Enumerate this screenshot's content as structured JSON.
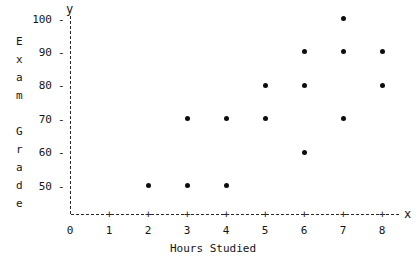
{
  "chart_data": {
    "type": "scatter",
    "title": "",
    "xlabel": "Hours Studied",
    "ylabel": "Exam Grade",
    "x_axis_name": "x",
    "y_axis_name": "y",
    "xticks": [
      0,
      1,
      2,
      3,
      4,
      5,
      6,
      7,
      8
    ],
    "yticks": [
      50,
      60,
      70,
      80,
      90,
      100
    ],
    "xlim": [
      0,
      8.6
    ],
    "ylim": [
      45,
      103
    ],
    "grid": false,
    "legend": null,
    "points": [
      {
        "x": 2,
        "y": 50
      },
      {
        "x": 3,
        "y": 50
      },
      {
        "x": 4,
        "y": 50
      },
      {
        "x": 3,
        "y": 70
      },
      {
        "x": 4,
        "y": 70
      },
      {
        "x": 5,
        "y": 70
      },
      {
        "x": 7,
        "y": 70
      },
      {
        "x": 6,
        "y": 60
      },
      {
        "x": 5,
        "y": 80
      },
      {
        "x": 6,
        "y": 80
      },
      {
        "x": 8,
        "y": 80
      },
      {
        "x": 6,
        "y": 90
      },
      {
        "x": 7,
        "y": 90
      },
      {
        "x": 8,
        "y": 90
      },
      {
        "x": 7,
        "y": 100
      }
    ]
  },
  "ylabel_letters": [
    "E",
    "x",
    "a",
    "m",
    "",
    "G",
    "r",
    "a",
    "d",
    "e"
  ]
}
